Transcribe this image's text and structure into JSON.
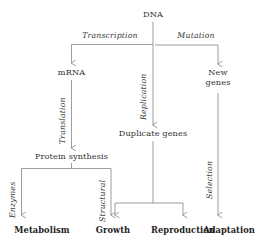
{
  "diagram": {
    "background_color": "#ffffff",
    "line_color": "#8c8c8c",
    "text_color": "#2f2f2f",
    "nodes": {
      "dna": "DNA",
      "mrna": "mRNA",
      "new_genes_line1": "New",
      "new_genes_line2": "genes",
      "duplicate_genes": "Duplicate genes",
      "protein_synthesis": "Protein synthesis"
    },
    "terminals": {
      "metabolism": "Metabolism",
      "growth": "Growth",
      "reproduction": "Reproduction",
      "adaptation": "Adaptation"
    },
    "edge_labels": {
      "transcription": "Transcription",
      "mutation": "Mutation",
      "replication": "Replication",
      "translation": "Translation",
      "selection": "Selection",
      "enzymes": "Enzymes",
      "structural": "Structural"
    }
  }
}
